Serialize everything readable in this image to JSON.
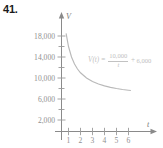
{
  "figure": {
    "problem_number": "41.",
    "formula": {
      "function_name": "V(t)",
      "equals": "=",
      "numerator": "10,000",
      "denominator": "t",
      "plus": "+",
      "constant": "6,000",
      "plain_text": "V(t) = 10,000/t + 6,000"
    },
    "colors": {
      "axis": "#8a8a8a",
      "curve": "#b9b9b9",
      "tick_label": "#8f8f8f",
      "formula": "#c2c2c2",
      "problem_number": "#1a1a1a",
      "background": "#ffffff"
    }
  },
  "chart_data": {
    "type": "line",
    "title": "",
    "xlabel": "t",
    "ylabel": "V",
    "xlim": [
      0,
      7
    ],
    "ylim": [
      0,
      20000
    ],
    "grid": false,
    "legend": null,
    "x_ticks": [
      1,
      2,
      3,
      4,
      5,
      6
    ],
    "x_tick_labels": [
      "1",
      "2",
      "3",
      "4",
      "5",
      "6"
    ],
    "y_ticks": [
      2000,
      4000,
      6000,
      8000,
      10000,
      12000,
      14000,
      16000,
      18000
    ],
    "y_tick_labels": [
      "2,000",
      "",
      "6,000",
      "",
      "10,000",
      "",
      "14,000",
      "",
      "18,000"
    ],
    "y_labeled_ticks": [
      2000,
      6000,
      10000,
      14000,
      18000
    ],
    "annotations": [
      {
        "text": "V(t) = 10,000/t + 6,000",
        "x": 3.4,
        "y": 14000
      }
    ],
    "series": [
      {
        "name": "V(t) = 10,000/t + 6,000",
        "equation": "V(t) = 10000/t + 6000",
        "x": [
          0.65,
          0.8,
          1,
          1.25,
          1.5,
          1.75,
          2,
          2.5,
          3,
          3.5,
          4,
          4.5,
          5,
          5.5,
          6,
          6.2
        ],
        "values": [
          21385,
          18500,
          16000,
          14000,
          12667,
          11714,
          11000,
          10000,
          9333,
          8857,
          8500,
          8222,
          8000,
          7818,
          7667,
          7613
        ]
      }
    ]
  }
}
